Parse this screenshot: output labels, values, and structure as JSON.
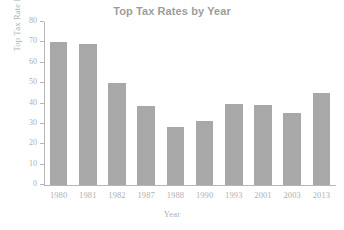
{
  "chart_data": {
    "type": "bar",
    "title": "Top Tax Rates by Year",
    "xlabel": "Year",
    "ylabel": "Top Tax Rate Percent",
    "categories": [
      "1980",
      "1981",
      "1982",
      "1987",
      "1988",
      "1990",
      "1993",
      "2001",
      "2003",
      "2013"
    ],
    "values": [
      70,
      69,
      50,
      38.8,
      28.4,
      31.4,
      39.6,
      39.1,
      35.3,
      45
    ],
    "ylim": [
      0,
      80
    ],
    "yticks": [
      0,
      10,
      20,
      30,
      40,
      50,
      60,
      70,
      80
    ],
    "ytick_labels": [
      "0",
      "10",
      "20",
      "30",
      "40",
      "50",
      "60",
      "70",
      "80"
    ],
    "grid": false,
    "legend": null,
    "bar_color": "#a8a8a8",
    "axis_color": "#b5b5b5",
    "text_color": "#b0b0b0",
    "title_color": "#9d9d9d"
  }
}
